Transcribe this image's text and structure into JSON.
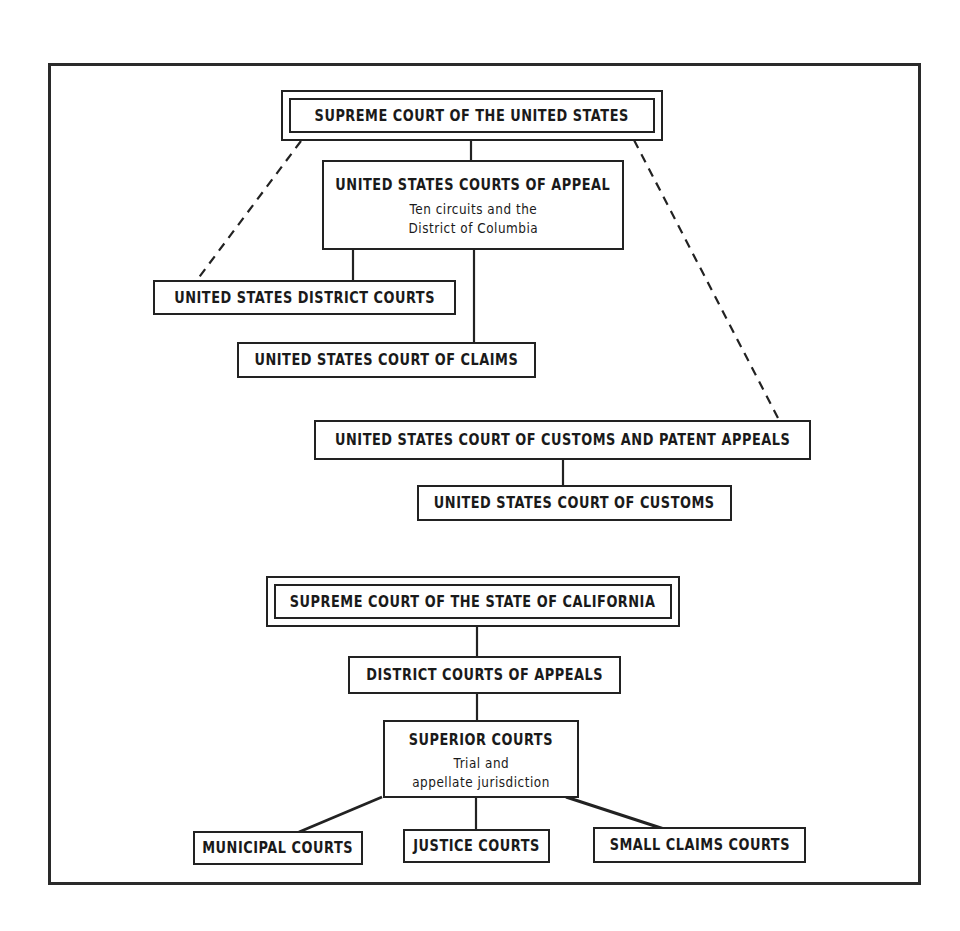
{
  "diagram": {
    "federal": {
      "supreme_court": {
        "title": "SUPREME COURT OF THE UNITED STATES"
      },
      "courts_of_appeal": {
        "title": "UNITED STATES COURTS OF APPEAL",
        "sub_line1": "Ten circuits and the",
        "sub_line2": "District of Columbia"
      },
      "district_courts": {
        "title": "UNITED STATES DISTRICT COURTS"
      },
      "court_of_claims": {
        "title": "UNITED STATES COURT OF CLAIMS"
      },
      "customs_patent_appeals": {
        "title": "UNITED STATES COURT OF CUSTOMS AND PATENT APPEALS"
      },
      "court_of_customs": {
        "title": "UNITED STATES COURT OF CUSTOMS"
      }
    },
    "california": {
      "supreme_court": {
        "title": "SUPREME COURT OF THE STATE OF CALIFORNIA"
      },
      "district_courts_of_appeals": {
        "title": "DISTRICT COURTS OF APPEALS"
      },
      "superior_courts": {
        "title": "SUPERIOR COURTS",
        "sub_line1": "Trial and",
        "sub_line2": "appellate jurisdiction"
      },
      "municipal_courts": {
        "title": "MUNICIPAL COURTS"
      },
      "justice_courts": {
        "title": "JUSTICE COURTS"
      },
      "small_claims_courts": {
        "title": "SMALL CLAIMS COURTS"
      }
    },
    "colors": {
      "ink": "#222222",
      "paper": "#ffffff"
    }
  }
}
